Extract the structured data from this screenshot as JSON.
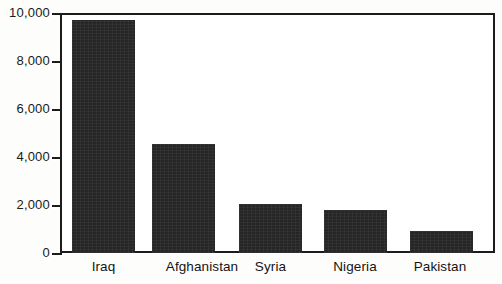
{
  "chart_data": {
    "type": "bar",
    "title": "",
    "subtitle": "",
    "xlabel": "",
    "ylabel": "",
    "categories": [
      "Iraq",
      "Afghanistan",
      "Syria",
      "Nigeria",
      "Pakistan"
    ],
    "values": [
      9700,
      4550,
      2050,
      1800,
      900
    ],
    "ylim": [
      0,
      10000
    ],
    "yticks": [
      0,
      2000,
      4000,
      6000,
      8000,
      10000
    ],
    "ytick_labels": [
      "0",
      "2,000",
      "4,000",
      "6,000",
      "8,000",
      "10,000"
    ],
    "grid": false,
    "legend": null,
    "legend_position": "none",
    "bar_color": "#262626",
    "axis_color": "#1c1c1c",
    "background_color": "#ffffff",
    "annotations": []
  },
  "axes": {
    "y_tick_labels": [
      "10,000",
      "8,000",
      "6,000",
      "4,000",
      "2,000",
      "0"
    ],
    "x_tick_labels": [
      "Iraq",
      "Afghanistan",
      "Syria",
      "Nigeria",
      "Pakistan"
    ]
  }
}
